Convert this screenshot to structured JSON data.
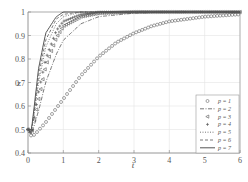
{
  "chart_data": {
    "type": "line",
    "title": "",
    "xlabel": "t",
    "ylabel": "z",
    "xlim": [
      0,
      6
    ],
    "ylim": [
      0.4,
      1.0
    ],
    "xticks": [
      "0",
      "1",
      "2",
      "3",
      "4",
      "5",
      "6"
    ],
    "yticks": [
      "0.4",
      "0.5",
      "0.6",
      "0.7",
      "0.8",
      "0.9",
      "1"
    ],
    "grid": true,
    "legend_position": "lower right",
    "series": [
      {
        "name": "p=1",
        "marker": "circle",
        "x": [
          0,
          0.1,
          0.2,
          0.5,
          1,
          1.5,
          2,
          2.5,
          3,
          3.5,
          4,
          5,
          6
        ],
        "values": [
          0.5,
          0.47,
          0.48,
          0.53,
          0.63,
          0.73,
          0.81,
          0.87,
          0.91,
          0.94,
          0.96,
          0.98,
          0.99
        ]
      },
      {
        "name": "p=2",
        "marker": "dash-dot",
        "x": [
          0,
          0.1,
          0.3,
          0.5,
          0.8,
          1,
          1.5,
          2,
          3,
          4,
          6
        ],
        "values": [
          0.5,
          0.48,
          0.58,
          0.7,
          0.82,
          0.88,
          0.95,
          0.98,
          0.995,
          1.0,
          1.0
        ]
      },
      {
        "name": "p=3",
        "marker": "triangle-left",
        "x": [
          0,
          0.1,
          0.3,
          0.5,
          0.8,
          1,
          1.5,
          2,
          3,
          6
        ],
        "values": [
          0.5,
          0.48,
          0.63,
          0.77,
          0.89,
          0.94,
          0.98,
          0.995,
          1.0,
          1.0
        ]
      },
      {
        "name": "p=4",
        "marker": "plus",
        "x": [
          0,
          0.1,
          0.3,
          0.5,
          0.8,
          1,
          1.5,
          2,
          3,
          6
        ],
        "values": [
          0.5,
          0.48,
          0.66,
          0.8,
          0.92,
          0.96,
          0.99,
          1.0,
          1.0,
          1.0
        ]
      },
      {
        "name": "p=5",
        "marker": "dotted",
        "x": [
          0,
          0.1,
          0.3,
          0.5,
          0.8,
          1,
          1.5,
          2,
          6
        ],
        "values": [
          0.5,
          0.49,
          0.7,
          0.85,
          0.95,
          0.98,
          1.0,
          1.0,
          1.0
        ]
      },
      {
        "name": "p=6",
        "marker": "dashed",
        "x": [
          0,
          0.1,
          0.3,
          0.5,
          0.8,
          1,
          1.5,
          6
        ],
        "values": [
          0.5,
          0.49,
          0.73,
          0.88,
          0.97,
          0.99,
          1.0,
          1.0
        ]
      },
      {
        "name": "p=7",
        "marker": "solid",
        "x": [
          0,
          0.1,
          0.3,
          0.5,
          0.8,
          1,
          6
        ],
        "values": [
          0.5,
          0.5,
          0.76,
          0.91,
          0.98,
          1.0,
          1.0
        ]
      }
    ]
  },
  "legend": {
    "entries": [
      {
        "label": "p = 1"
      },
      {
        "label": "p = 2"
      },
      {
        "label": "p = 3"
      },
      {
        "label": "p = 4"
      },
      {
        "label": "p = 5"
      },
      {
        "label": "p = 6"
      },
      {
        "label": "p = 7"
      }
    ]
  },
  "axes": {
    "xlabel": "t",
    "ylabel": "z",
    "xticks": [
      "0",
      "1",
      "2",
      "3",
      "4",
      "5",
      "6"
    ],
    "yticks": [
      "0.4",
      "0.5",
      "0.6",
      "0.7",
      "0.8",
      "0.9",
      "1"
    ]
  },
  "colors": {
    "axis": "#888888",
    "grid": "#e4e4e4",
    "line": "#555555"
  }
}
